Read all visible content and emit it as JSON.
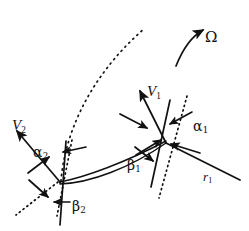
{
  "figure": {
    "type": "technical-line-diagram",
    "width": 249,
    "height": 231,
    "background_color": "#ffffff",
    "line_color": "#111111"
  },
  "labels": {
    "v1": {
      "text": "V",
      "sub": "1",
      "x": 147,
      "y": 84,
      "style": "italic"
    },
    "v2": {
      "text": "V",
      "sub": "2",
      "x": 12,
      "y": 118,
      "style": "italic"
    },
    "alpha1": {
      "text": "α",
      "sub": "1",
      "x": 193,
      "y": 119,
      "style": "greek"
    },
    "alpha2": {
      "text": "α",
      "sub": "2",
      "x": 33,
      "y": 145,
      "style": "greek"
    },
    "beta1": {
      "text": "β",
      "sub": "1",
      "x": 127,
      "y": 158,
      "style": "greek"
    },
    "beta2": {
      "text": "β",
      "sub": "2",
      "x": 72,
      "y": 199,
      "style": "greek"
    },
    "r1": {
      "text": "r",
      "sub": "1",
      "x": 203,
      "y": 170,
      "style": "italic"
    },
    "omega": {
      "text": "Ω",
      "sub": "",
      "x": 205,
      "y": 30,
      "style": "greek"
    }
  },
  "geometry": {
    "inlet_point": {
      "x": 165,
      "y": 143
    },
    "outlet_point": {
      "x": 60,
      "y": 182
    },
    "blade_upper": "M60,182 C85,178 125,163 165,142",
    "blade_lower": "M60,183 C88,182 128,168 165,144",
    "streamline_dotted": "M61,181 C64,140 85,80 145,28",
    "inlet_tangent_line": {
      "x1": 169,
      "y1": 101,
      "x2": 152,
      "y2": 186
    },
    "inlet_radial_dotted": {
      "x1": 186,
      "y1": 97,
      "x2": 160,
      "y2": 196
    },
    "outlet_normal_line": {
      "x1": 66,
      "y1": 142,
      "x2": 60,
      "y2": 224
    },
    "outlet_radial_dotted": {
      "x1": 72,
      "y1": 141,
      "x2": 58,
      "y2": 214
    },
    "outlet_tangent_dotted": {
      "x1": 58,
      "y1": 182,
      "x2": 18,
      "y2": 214
    },
    "radius_line_r1": {
      "x1": 165,
      "y1": 143,
      "x2": 238,
      "y2": 179
    },
    "v1_arrow": {
      "x1": 165,
      "y1": 143,
      "x2": 139,
      "y2": 90
    },
    "v2_arrow": {
      "x1": 60,
      "y1": 182,
      "x2": 18,
      "y2": 132
    },
    "omega_arc": "M177,64 C186,44 196,34 205,29"
  },
  "arrows": {
    "v1_relative": {
      "x1": 122,
      "y1": 116,
      "x2": 146,
      "y2": 128,
      "desc": "relative-velocity-arrow-inlet"
    },
    "v1_blade_tangent": {
      "x1": 139,
      "y1": 153,
      "x2": 160,
      "y2": 139,
      "desc": "blade-tangent-arrow-inlet"
    },
    "alpha1_marker": {
      "x1": 190,
      "y1": 113,
      "x2": 171,
      "y2": 124,
      "desc": "alpha1-angle-arrow"
    },
    "r1_marker": {
      "x1": 197,
      "y1": 152,
      "x2": 170,
      "y2": 143,
      "desc": "r1-direction-arrow"
    },
    "beta1_marker": {
      "x1": 136,
      "y1": 148,
      "x2": 152,
      "y2": 160,
      "desc": "beta1-angle-arrow"
    },
    "alpha2_marker": {
      "x1": 30,
      "y1": 171,
      "x2": 48,
      "y2": 157,
      "desc": "alpha2-angle-arrow"
    },
    "alpha2_top": {
      "x1": 84,
      "y1": 147,
      "x2": 64,
      "y2": 152,
      "desc": "alpha2-top-arrow"
    },
    "beta2_marker": {
      "x1": 68,
      "y1": 202,
      "x2": 55,
      "y2": 202,
      "desc": "beta2-angle-arrow"
    },
    "outlet_lower": {
      "x1": 30,
      "y1": 181,
      "x2": 47,
      "y2": 196,
      "desc": "outlet-lower-arrow"
    }
  }
}
